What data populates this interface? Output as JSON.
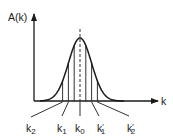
{
  "diagram": {
    "type": "gaussian-wave-packet",
    "y_axis_label": "A(k)",
    "x_axis_label": "k",
    "ink_color": "#1a1a1a",
    "center_label": "k0",
    "lines": [
      {
        "id": "k2",
        "base": "k",
        "sub": "2",
        "prime": false,
        "offset": -3
      },
      {
        "id": "k1",
        "base": "k",
        "sub": "1",
        "prime": false,
        "offset": -2
      },
      {
        "id": "km",
        "base": "",
        "sub": "",
        "prime": false,
        "offset": -1
      },
      {
        "id": "k0",
        "base": "k",
        "sub": "0",
        "prime": false,
        "offset": 0
      },
      {
        "id": "kpm",
        "base": "",
        "sub": "",
        "prime": false,
        "offset": 1
      },
      {
        "id": "k1p",
        "base": "k",
        "sub": "1",
        "prime": true,
        "offset": 2
      },
      {
        "id": "k2p",
        "base": "k",
        "sub": "2",
        "prime": true,
        "offset": 3
      }
    ],
    "labels": [
      {
        "id": "k2",
        "base": "k",
        "sub": "2",
        "prime": ""
      },
      {
        "id": "k1",
        "base": "k",
        "sub": "1",
        "prime": ""
      },
      {
        "id": "k0",
        "base": "k",
        "sub": "0",
        "prime": ""
      },
      {
        "id": "k1p",
        "base": "k",
        "sub": "1",
        "prime": "′"
      },
      {
        "id": "k2p",
        "base": "k",
        "sub": "2",
        "prime": "′"
      }
    ]
  }
}
